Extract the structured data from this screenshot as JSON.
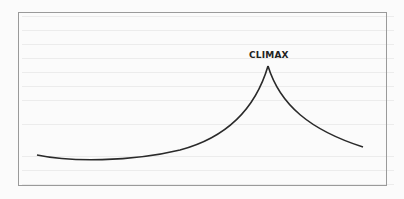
{
  "diagram": {
    "title": "",
    "peak_label": "CLIMAX",
    "curve": {
      "start": [
        37,
        155
      ],
      "low_point": [
        100,
        160
      ],
      "peak": [
        268,
        66
      ],
      "end": [
        363,
        147
      ],
      "stroke": "#2a2a2a"
    },
    "frame_color": "#9a9a9a"
  }
}
